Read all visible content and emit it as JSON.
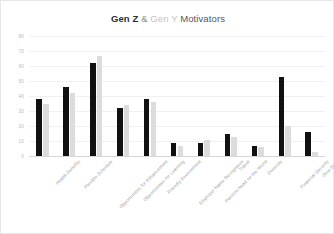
{
  "chart_data": {
    "type": "bar",
    "title": "Gen Z & Gen Y Motivators",
    "title_parts": {
      "strong": "Gen Z",
      "amp": " & ",
      "faint": "Gen Y",
      "rest": " Motivators"
    },
    "xlabel": "",
    "ylabel": "",
    "ylim": [
      0,
      80
    ],
    "ytick_step": 10,
    "grid": true,
    "legend": "none",
    "categories": [
      "Health Benefits",
      "Flexible Schedule",
      "Opportunities for Advancement",
      "Opportunities for Learning",
      "Friendly Environment",
      "Employer Name Recognition",
      "Passion head on the World",
      "Travel",
      "Diversity",
      "Financial Security",
      "Own Boss"
    ],
    "yticks": [
      "80",
      "70",
      "60",
      "50",
      "40",
      "30",
      "20",
      "10",
      "0"
    ],
    "series": [
      {
        "name": "Gen Z",
        "color": "#111111",
        "values": [
          38,
          46,
          62,
          32,
          38,
          9,
          9,
          15,
          7,
          53,
          16
        ]
      },
      {
        "name": "Gen Y",
        "color": "#dcdcdc",
        "values": [
          35,
          42,
          67,
          34,
          36,
          7,
          11,
          13,
          6,
          20,
          3
        ]
      }
    ]
  },
  "colors": {
    "background": "#ffffff",
    "frame": "#e6e6e6",
    "grid": "#f0f0f0",
    "axis": "#d6d6d6",
    "gen_z": "#111111",
    "gen_y": "#dcdcdc",
    "tick_text": "#b9b9b9",
    "label_text": "#9a9a9a"
  }
}
